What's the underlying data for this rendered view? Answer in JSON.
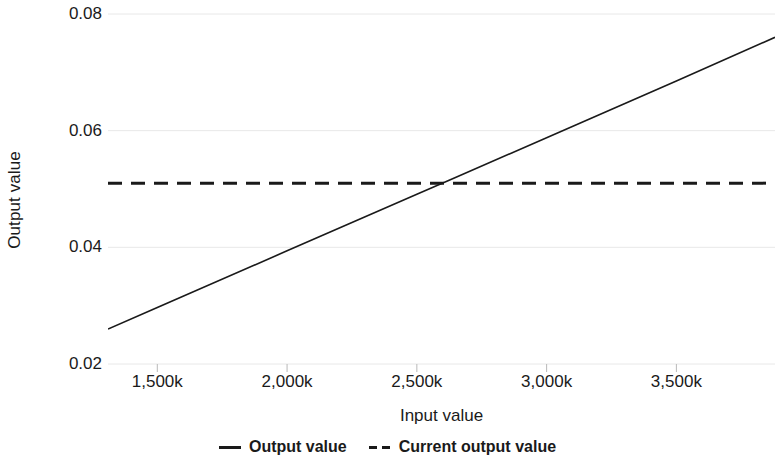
{
  "chart_data": {
    "type": "line",
    "title": "",
    "xlabel": "Input value",
    "ylabel": "Output value",
    "xlim": [
      1310000,
      3880000
    ],
    "ylim": [
      0.02,
      0.08
    ],
    "grid": true,
    "legend_position": "bottom",
    "x_tick_labels": [
      "1,500k",
      "2,000k",
      "2,500k",
      "3,000k",
      "3,500k"
    ],
    "x_tick_values": [
      1500000,
      2000000,
      2500000,
      3000000,
      3500000
    ],
    "y_tick_labels": [
      "0.08",
      "0.06",
      "0.04",
      "0.02"
    ],
    "y_tick_values": [
      0.08,
      0.06,
      0.04,
      0.02
    ],
    "series": [
      {
        "name": "Output value",
        "style": "solid",
        "color": "#1a1a1a",
        "x": [
          1310000,
          1500000,
          2000000,
          2500000,
          2640000,
          3000000,
          3500000,
          3880000
        ],
        "values": [
          0.026,
          0.0297,
          0.0394,
          0.0491,
          0.0518,
          0.0588,
          0.0685,
          0.076
        ]
      },
      {
        "name": "Current output value",
        "style": "dashed",
        "color": "#1a1a1a",
        "x": [
          1310000,
          3880000
        ],
        "values": [
          0.051,
          0.051
        ]
      }
    ],
    "annotations": []
  },
  "legend": {
    "items": [
      {
        "label": "Output value",
        "marker": "solid-line-icon"
      },
      {
        "label": "Current output value",
        "marker": "dashed-line-icon"
      }
    ]
  },
  "colors": {
    "line": "#1a1a1a",
    "grid": "#e8e8e8",
    "tick": "#b9b9b9",
    "background": "#ffffff",
    "text": "#1a1a1a"
  }
}
